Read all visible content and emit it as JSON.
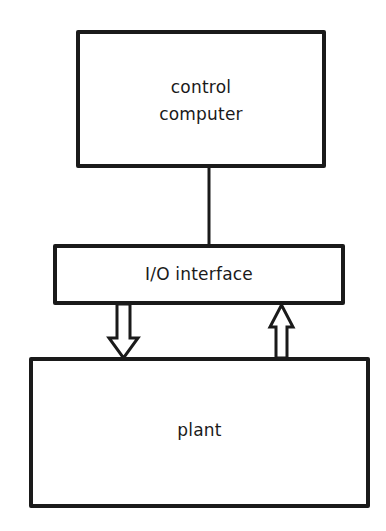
{
  "diagram": {
    "type": "block-diagram",
    "blocks": [
      {
        "id": "computer",
        "label": "control\ncomputer"
      },
      {
        "id": "io",
        "label": "I/O interface"
      },
      {
        "id": "plant",
        "label": "plant"
      }
    ],
    "connections": [
      {
        "from": "computer",
        "to": "io",
        "style": "line"
      },
      {
        "from": "io",
        "to": "plant",
        "style": "hollow-arrow-down"
      },
      {
        "from": "plant",
        "to": "io",
        "style": "hollow-arrow-up"
      }
    ],
    "colors": {
      "stroke": "#1a1a1a",
      "background": "#ffffff"
    }
  }
}
